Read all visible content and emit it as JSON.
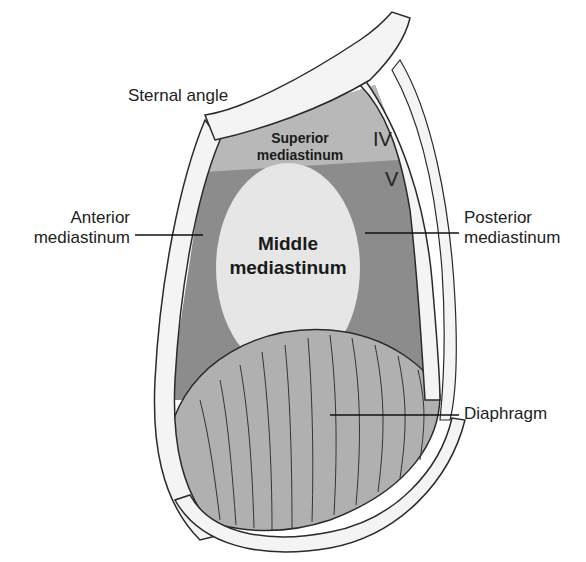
{
  "figure": {
    "labels": {
      "sternal_angle": "Sternal angle",
      "anterior": [
        "Anterior",
        "mediastinum"
      ],
      "posterior": [
        "Posterior",
        "mediastinum"
      ],
      "diaphragm": "Diaphragm",
      "superior": [
        "Superior",
        "mediastinum"
      ],
      "middle": [
        "Middle",
        "mediastinum"
      ]
    },
    "vertebra_labels": [
      "IV",
      "V"
    ],
    "colors": {
      "superior_region": "#b8b8b8",
      "anterior_posterior_region": "#8c8c8c",
      "middle_region": "#e6e6e6",
      "diaphragm": "#b0b0b0",
      "bone": "#f4f4f4",
      "outline": "#2a2a2a"
    }
  }
}
